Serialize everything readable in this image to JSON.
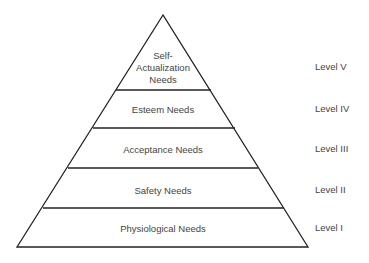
{
  "diagram": {
    "type": "pyramid",
    "tiers": [
      {
        "name": "Self-Actualization Needs",
        "lines": [
          "Self-",
          "Actualization",
          "Needs"
        ],
        "level": "Level V"
      },
      {
        "name": "Esteem Needs",
        "lines": [
          "Esteem Needs"
        ],
        "level": "Level IV"
      },
      {
        "name": "Acceptance Needs",
        "lines": [
          "Acceptance Needs"
        ],
        "level": "Level III"
      },
      {
        "name": "Safety Needs",
        "lines": [
          "Safety Needs"
        ],
        "level": "Level II"
      },
      {
        "name": "Physiological Needs",
        "lines": [
          "Physiological Needs"
        ],
        "level": "Level I"
      }
    ]
  }
}
